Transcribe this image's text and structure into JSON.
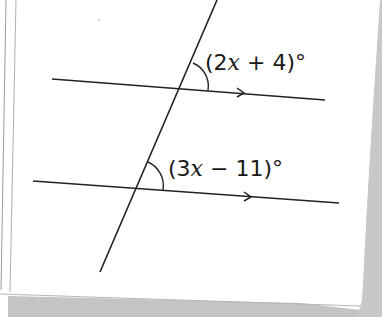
{
  "diagram": {
    "type": "parallel-lines-cut-by-transversal",
    "colors": {
      "ink": "#222222",
      "paper": "#ffffff",
      "shadow": "#bdbdbd",
      "edge": "#9a9a9a"
    },
    "angles": [
      {
        "id": "upper",
        "prefix": "(2",
        "variable": "x",
        "suffix": " + 4)°",
        "position": "above top parallel line, right of transversal"
      },
      {
        "id": "lower",
        "prefix": "(3",
        "variable": "x",
        "suffix": " − 11)°",
        "position": "above bottom parallel line, right of transversal"
      }
    ],
    "lines": {
      "transversal": {
        "x1": 217,
        "y1": 0,
        "x2": 100,
        "y2": 272
      },
      "parallel_top": {
        "x1": 52,
        "y1": 79,
        "x2": 325,
        "y2": 100,
        "arrow": true
      },
      "parallel_bottom": {
        "x1": 33,
        "y1": 181,
        "x2": 339,
        "y2": 203,
        "arrow": true
      }
    }
  }
}
